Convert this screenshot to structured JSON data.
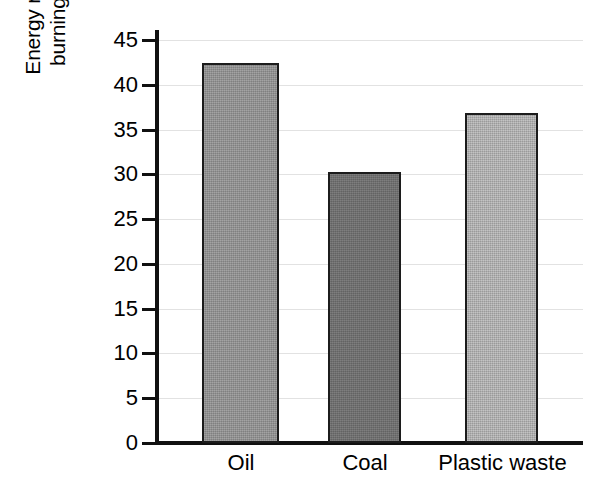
{
  "chart_data": {
    "type": "bar",
    "title": "",
    "subtitle": "",
    "xlabel": "",
    "ylabel": "Energy released by burning 1 kg (MJ)",
    "ylabel_lines": [
      "Energy released by",
      "burning 1 kg (MJ)"
    ],
    "categories": [
      "Oil",
      "Coal",
      "Plastic waste"
    ],
    "values": [
      42.4,
      30.3,
      36.9
    ],
    "ylim": [
      0,
      45
    ],
    "ytick_labels": [
      "45",
      "40",
      "35",
      "30",
      "25",
      "20",
      "15",
      "10",
      "5",
      "0"
    ],
    "ytick_values": [
      45,
      40,
      35,
      30,
      25,
      20,
      15,
      10,
      5,
      0
    ],
    "ytick_step": 5,
    "grid": true,
    "grid_axis": "y",
    "legend": false,
    "legend_position": "none",
    "annotations": [],
    "bar_colors": [
      "#8e8e8e",
      "#6c6c6c",
      "#ababab"
    ],
    "bar_edge_color": "#1c1c1c",
    "axis_color": "#111111",
    "grid_color": "#e2e2e2",
    "background_color": "#ffffff"
  }
}
